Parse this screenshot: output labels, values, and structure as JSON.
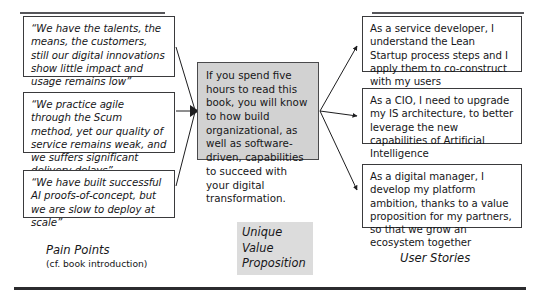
{
  "diagram": {
    "title_left": "Pain Points",
    "subtitle_left": "(cf. book introduction)",
    "title_center_line1": "Unique",
    "title_center_line2": "Value",
    "title_center_line3": "Proposition",
    "title_right": "User Stories",
    "colors": {
      "box_border": "#3a3a3c",
      "uvp_fill": "#d2d2d2",
      "uvp_caption_fill": "#dcdcdc",
      "rule": "#2b2b2e",
      "text": "#161618"
    }
  },
  "pain_points": [
    {
      "id": "pain-1",
      "text": "“We have the talents, the means, the customers, still our digital innovations show little impact and usage remains low”"
    },
    {
      "id": "pain-2",
      "text": "“We practice agile through the Scum method, yet our quality of service remains weak, and we suffers significant delivery delays”"
    },
    {
      "id": "pain-3",
      "text": "“We have built successful AI proofs-of-concept, but we are slow to deploy at scale”"
    }
  ],
  "value_proposition": {
    "text": "If you spend five hours to read this book, you will know to how build organizational, as well as software-driven, capabilities to succeed with your digital transformation."
  },
  "user_stories": [
    {
      "id": "story-1",
      "text": "As a service developer, I understand the Lean Startup process steps and I apply them to co-construct with my users"
    },
    {
      "id": "story-2",
      "text": "As a CIO, I need to upgrade my IS architecture, to better leverage the new capabilities of Artificial Intelligence"
    },
    {
      "id": "story-3",
      "text": "As a digital manager, I develop my platform ambition, thanks to a value proposition for my partners, so that we grow an ecosystem together"
    }
  ]
}
